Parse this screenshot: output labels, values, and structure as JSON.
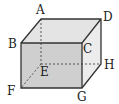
{
  "figure": {
    "type": "rectangular cuboid (cube) in oblique projection",
    "colors": {
      "front_face": "#cfcfcf",
      "top_face": "#e4e4e4",
      "side_face": "#ececec",
      "edge": "#333333",
      "hidden_edge": "#555555"
    },
    "vertices": [
      {
        "label": "A",
        "x": 41,
        "y": 19,
        "lx": 36,
        "ly": 14
      },
      {
        "label": "D",
        "x": 101,
        "y": 19,
        "lx": 103,
        "ly": 20
      },
      {
        "label": "B",
        "x": 21,
        "y": 43,
        "lx": 8,
        "ly": 48
      },
      {
        "label": "C",
        "x": 82,
        "y": 43,
        "lx": 83,
        "ly": 53
      },
      {
        "label": "E",
        "x": 41,
        "y": 64,
        "lx": 40,
        "ly": 76
      },
      {
        "label": "H",
        "x": 101,
        "y": 64,
        "lx": 104,
        "ly": 69
      },
      {
        "label": "F",
        "x": 21,
        "y": 88,
        "lx": 7,
        "ly": 95
      },
      {
        "label": "G",
        "x": 82,
        "y": 88,
        "lx": 77,
        "ly": 101
      }
    ],
    "hidden_edges": [
      "AE",
      "EF",
      "EH"
    ]
  }
}
